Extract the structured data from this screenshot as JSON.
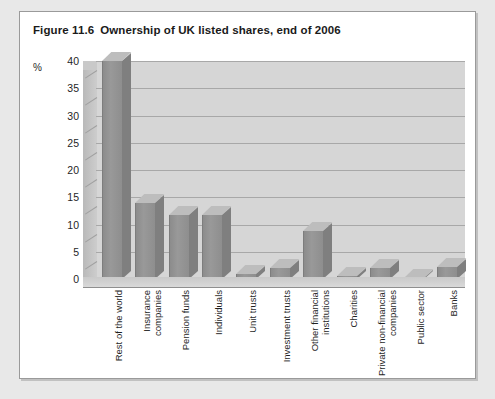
{
  "figure": {
    "number": "Figure 11.6",
    "title": "Ownership of UK listed shares, end of 2006"
  },
  "chart_data": {
    "type": "bar",
    "title": "Ownership of UK listed shares, end of 2006",
    "xlabel": "",
    "ylabel": "%",
    "unit_label": "%",
    "ylim": [
      0,
      40
    ],
    "yticks": [
      0,
      5,
      10,
      15,
      20,
      25,
      30,
      35,
      40
    ],
    "grid": true,
    "legend": "none",
    "style": "3d-column",
    "categories": [
      "Rest of the world",
      "Insurance companies",
      "Pension funds",
      "Individuals",
      "Unit trusts",
      "Investment trusts",
      "Other financial institutions",
      "Charities",
      "Private non-financial companies",
      "Public sector",
      "Banks"
    ],
    "category_lines": [
      [
        "Rest of the world"
      ],
      [
        "Insurance",
        "companies"
      ],
      [
        "Pension funds"
      ],
      [
        "Individuals"
      ],
      [
        "Unit trusts"
      ],
      [
        "Investment trusts"
      ],
      [
        "Other financial",
        "institutions"
      ],
      [
        "Charities"
      ],
      [
        "Private non-financial",
        "companies"
      ],
      [
        "Public sector"
      ],
      [
        "Banks"
      ]
    ],
    "values": [
      40.0,
      14.0,
      11.7,
      11.7,
      1.0,
      2.0,
      8.8,
      0.5,
      2.0,
      0.1,
      2.2
    ],
    "colors": {
      "bar_front": "#949494",
      "bar_top": "#bdbdbd",
      "bar_side": "#7f7f7f",
      "plot_background": "#d6d6d6",
      "gridline": "#a8a8a8",
      "page_background": "#e8e8e8",
      "frame_background": "#ffffff",
      "frame_border": "#9a9a9a",
      "text": "#1a1a1a"
    }
  }
}
